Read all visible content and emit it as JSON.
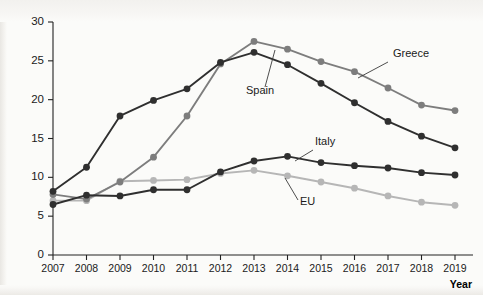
{
  "figure": {
    "ghost_text": "",
    "width": 483,
    "height": 295
  },
  "chart_data": {
    "type": "line",
    "title": "",
    "subtitle": "",
    "xlabel": "Year",
    "ylabel": "",
    "x": [
      2007,
      2008,
      2009,
      2010,
      2011,
      2012,
      2013,
      2014,
      2015,
      2016,
      2017,
      2018,
      2019
    ],
    "categories": [
      "2007",
      "2008",
      "2009",
      "2010",
      "2011",
      "2012",
      "2013",
      "2014",
      "2015",
      "2016",
      "2017",
      "2018",
      "2019"
    ],
    "xlim": [
      2007,
      2019
    ],
    "ylim": [
      0,
      30
    ],
    "yticks": [
      0,
      5,
      10,
      15,
      20,
      25,
      30
    ],
    "ytick_labels": [
      "0",
      "5",
      "10",
      "15",
      "20",
      "25",
      "30"
    ],
    "grid": false,
    "legend": "annotations-on-lines",
    "series": [
      {
        "name": "Greece",
        "color": "#7d7d7d",
        "marker_color": "#7d7d7d",
        "values": [
          7.8,
          7.2,
          9.4,
          12.6,
          17.9,
          24.6,
          27.5,
          26.5,
          24.9,
          23.6,
          21.5,
          19.3,
          18.6
        ]
      },
      {
        "name": "Spain",
        "color": "#2f2f2f",
        "marker_color": "#2f2f2f",
        "values": [
          8.2,
          11.3,
          17.9,
          19.9,
          21.4,
          24.8,
          26.1,
          24.5,
          22.1,
          19.6,
          17.2,
          15.3,
          13.8
        ]
      },
      {
        "name": "Italy",
        "color": "#2f2f2f",
        "marker_color": "#2f2f2f",
        "values": [
          6.5,
          7.7,
          7.6,
          8.4,
          8.4,
          10.7,
          12.1,
          12.7,
          11.9,
          11.5,
          11.2,
          10.6,
          10.3
        ]
      },
      {
        "name": "EU",
        "color": "#b6b6b6",
        "marker_color": "#b6b6b6",
        "values": [
          7.0,
          7.0,
          9.5,
          9.6,
          9.7,
          10.5,
          10.9,
          10.2,
          9.4,
          8.6,
          7.6,
          6.8,
          6.4
        ]
      }
    ],
    "annotations": [
      {
        "text": "Greece",
        "label_x": 393,
        "label_y": 57,
        "leader": [
          [
            388,
            62
          ],
          [
            358,
            78
          ]
        ]
      },
      {
        "text": "Spain",
        "label_x": 246,
        "label_y": 94,
        "leader": [
          [
            265,
            87
          ],
          [
            275,
            50
          ]
        ]
      },
      {
        "text": "Italy",
        "label_x": 315,
        "label_y": 145,
        "leader": [
          [
            313,
            150
          ],
          [
            295,
            161
          ]
        ]
      },
      {
        "text": "EU",
        "label_x": 300,
        "label_y": 205,
        "leader": [
          [
            298,
            200
          ],
          [
            285,
            178
          ]
        ]
      }
    ]
  },
  "axes": {
    "x_axis_title": "Year",
    "x_tick_labels": [
      "2007",
      "2008",
      "2009",
      "2010",
      "2011",
      "2012",
      "2013",
      "2014",
      "2015",
      "2016",
      "2017",
      "2018",
      "2019"
    ],
    "y_tick_labels": [
      "30",
      "25",
      "20",
      "15",
      "10",
      "5",
      "0"
    ]
  }
}
